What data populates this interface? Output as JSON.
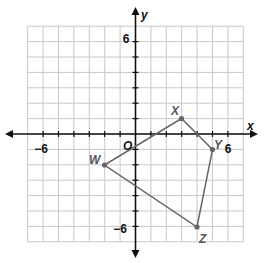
{
  "chart_data": {
    "type": "scatter",
    "title": "",
    "xlabel": "x",
    "ylabel": "y",
    "xlim": [
      -7,
      7
    ],
    "ylim": [
      -7,
      7
    ],
    "grid": true,
    "tick_labels": {
      "x": [
        "-6",
        "6"
      ],
      "y": [
        "6",
        "-6"
      ]
    },
    "origin_label": "O",
    "polygon": {
      "vertices": [
        {
          "label": "W",
          "x": -2,
          "y": -2
        },
        {
          "label": "X",
          "x": 3,
          "y": 1
        },
        {
          "label": "Y",
          "x": 5,
          "y": -1
        },
        {
          "label": "Z",
          "x": 4,
          "y": -6
        }
      ],
      "closed": true
    }
  },
  "labels": {
    "x_axis": "x",
    "y_axis": "y",
    "origin": "O",
    "x_neg6": "−6",
    "x_pos6": "6",
    "y_pos6": "6",
    "y_neg6": "−6",
    "W": "W",
    "X": "X",
    "Y": "Y",
    "Z": "Z"
  }
}
